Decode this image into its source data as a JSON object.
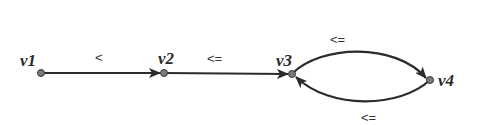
{
  "diagram": {
    "type": "directed-graph",
    "colors": {
      "edge": "#2b2b2b",
      "node_fill": "#7a7a7a",
      "text": "#2a2a2a",
      "background": "#ffffff"
    },
    "nodes": [
      {
        "id": "v1",
        "label": "v1",
        "x": 41,
        "y": 73
      },
      {
        "id": "v2",
        "label": "v2",
        "x": 164,
        "y": 73
      },
      {
        "id": "v3",
        "label": "v3",
        "x": 292,
        "y": 74
      },
      {
        "id": "v4",
        "label": "v4",
        "x": 430,
        "y": 80
      }
    ],
    "edges": [
      {
        "from": "v1",
        "to": "v2",
        "label": "<"
      },
      {
        "from": "v2",
        "to": "v3",
        "label": "<="
      },
      {
        "from": "v3",
        "to": "v4",
        "label": "<=",
        "curve": "upper"
      },
      {
        "from": "v4",
        "to": "v3",
        "label": "<=",
        "curve": "lower"
      }
    ]
  }
}
